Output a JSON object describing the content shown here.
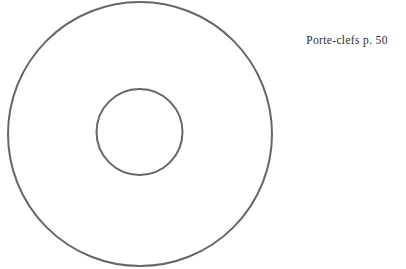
{
  "page": {
    "background_color": "#ffffff",
    "width": 406,
    "height": 269
  },
  "figure": {
    "name": "annular-disc-diagram",
    "stroke_color": "#666666",
    "fill_color": "none",
    "stroke_width": 2,
    "outer_circle": {
      "center_x": 140,
      "center_y": 134,
      "radius": 132
    },
    "inner_circle": {
      "center_x": 139.5,
      "center_y": 132,
      "radius": 43
    }
  },
  "caption": {
    "text": "Porte-clefs p. 50",
    "product_name": "Porte-clefs",
    "page_reference": "p. 50",
    "color": "#2e2e2e"
  }
}
